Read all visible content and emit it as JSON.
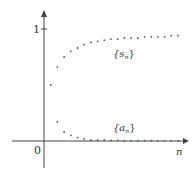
{
  "chart_data": {
    "type": "scatter",
    "title": "",
    "xlabel": "n",
    "ylabel": "",
    "origin_label": "0",
    "y_tick_labels": [
      "1"
    ],
    "y_ticks": [
      1
    ],
    "ylim": [
      -0.2,
      1.25
    ],
    "grid": false,
    "legend": "none (inline labels)",
    "annotations": [
      {
        "text": "{s_n}",
        "series": "s_n"
      },
      {
        "text": "{a_n}",
        "series": "a_n"
      }
    ],
    "series": [
      {
        "name": "{s_n}",
        "x": [
          1,
          2,
          3,
          4,
          5,
          6,
          7,
          8,
          9,
          10,
          11,
          12,
          13,
          14,
          15,
          16,
          17,
          18,
          19,
          20
        ],
        "values": [
          0.5,
          0.66,
          0.75,
          0.8,
          0.83,
          0.86,
          0.88,
          0.89,
          0.9,
          0.91,
          0.91,
          0.92,
          0.92,
          0.92,
          0.93,
          0.93,
          0.93,
          0.93,
          0.94,
          0.94
        ]
      },
      {
        "name": "{a_n}",
        "x": [
          2,
          3,
          4,
          5,
          6,
          7,
          8,
          9,
          10,
          11,
          12,
          13,
          14,
          15,
          16,
          17,
          18,
          19,
          20
        ],
        "values": [
          0.17,
          0.08,
          0.05,
          0.03,
          0.02,
          0.01,
          0.01,
          0.01,
          0.005,
          0.005,
          0.004,
          0.004,
          0.003,
          0.003,
          0.003,
          0.002,
          0.002,
          0.002,
          0.002
        ]
      }
    ]
  },
  "labels": {
    "y_tick_1": "1",
    "origin": "0",
    "x_axis": "n",
    "s_series_main": "{s",
    "s_series_sub": "n",
    "a_series_main": "{a",
    "a_series_sub": "n",
    "close_brace": "}"
  },
  "style": {
    "axis_color": "#444444",
    "point_color": "#555555",
    "text_color": "#333333"
  }
}
